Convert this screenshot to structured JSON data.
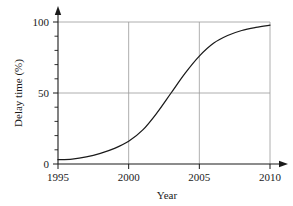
{
  "chart_data": {
    "type": "line",
    "title": "",
    "xlabel": "Year",
    "ylabel": "Delay time (%)",
    "xlim": [
      1995,
      2010
    ],
    "ylim": [
      0,
      100
    ],
    "xticks": [
      1995,
      2000,
      2005,
      2010
    ],
    "xtick_labels": [
      "1995",
      "2000",
      "2005",
      "2010"
    ],
    "yticks": [
      0,
      50,
      100
    ],
    "ytick_labels": [
      "0",
      "50",
      "100"
    ],
    "y_minor_ticks": [
      10,
      20,
      30,
      40,
      60,
      70,
      80,
      90
    ],
    "grid": {
      "horizontal_at": [
        50,
        100
      ],
      "vertical_at": [
        2000,
        2005,
        2010
      ],
      "color": "#9a9a9a"
    },
    "legend": null,
    "series": [
      {
        "name": "Delay time",
        "color": "#1a1a1a",
        "x": [
          1995,
          1996,
          1997,
          1998,
          1999,
          2000,
          2001,
          2002,
          2003,
          2004,
          2005,
          2006,
          2007,
          2008,
          2009,
          2010
        ],
        "values": [
          3,
          3.5,
          5,
          7.5,
          11,
          16,
          24,
          36,
          50,
          64,
          76,
          85,
          90.5,
          94,
          96.2,
          97.8
        ]
      }
    ],
    "axis_arrows": {
      "x_axis_right": true,
      "y_axis_top": true
    }
  },
  "labels": {
    "y_100": "100",
    "y_50": "50",
    "y_0": "0",
    "x_1995": "1995",
    "x_2000": "2000",
    "x_2005": "2005",
    "x_2010": "2010",
    "x_axis_title": "Year",
    "y_axis_title": "Delay time (%)"
  }
}
